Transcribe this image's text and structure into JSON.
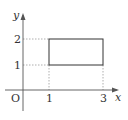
{
  "diagram": {
    "type": "coordinate-plane-rectangle",
    "axes": {
      "x_label": "x",
      "y_label": "y",
      "origin_label": "O"
    },
    "x_ticks": [
      {
        "value": 1,
        "label": "1"
      },
      {
        "value": 3,
        "label": "3"
      }
    ],
    "y_ticks": [
      {
        "value": 1,
        "label": "1"
      },
      {
        "value": 2,
        "label": "2"
      }
    ],
    "rectangle": {
      "x_min": 1,
      "x_max": 3,
      "y_min": 1,
      "y_max": 2,
      "vertices": [
        [
          1,
          1
        ],
        [
          3,
          1
        ],
        [
          3,
          2
        ],
        [
          1,
          2
        ]
      ]
    },
    "colors": {
      "axis": "#555555",
      "rect": "#333333",
      "guide": "#999999"
    }
  }
}
